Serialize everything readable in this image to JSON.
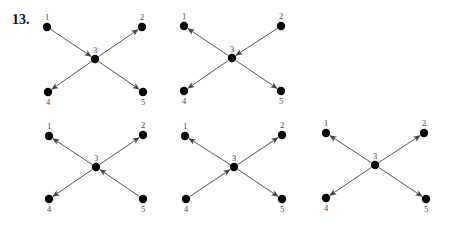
{
  "problem": {
    "number": "13."
  },
  "style": {
    "node_color": "#000000",
    "edge_color": "#555555",
    "label_color": "#444444",
    "background": "#ffffff"
  },
  "diagrams": [
    {
      "id": "graph-1",
      "nodes": [
        {
          "id": "1",
          "label": "1",
          "x": 47,
          "y": 27,
          "label_pos": "above"
        },
        {
          "id": "2",
          "label": "2",
          "x": 142,
          "y": 27,
          "label_pos": "above"
        },
        {
          "id": "3",
          "label": "3",
          "x": 95,
          "y": 59,
          "label_pos": "above"
        },
        {
          "id": "4",
          "label": "4",
          "x": 48,
          "y": 92,
          "label_pos": "below"
        },
        {
          "id": "5",
          "label": "5",
          "x": 143,
          "y": 92,
          "label_pos": "below"
        }
      ],
      "edges": [
        {
          "from": "1",
          "to": "3"
        },
        {
          "from": "3",
          "to": "2"
        },
        {
          "from": "3",
          "to": "4"
        },
        {
          "from": "3",
          "to": "5"
        }
      ]
    },
    {
      "id": "graph-2",
      "nodes": [
        {
          "id": "1",
          "label": "1",
          "x": 184,
          "y": 26,
          "label_pos": "above"
        },
        {
          "id": "2",
          "label": "2",
          "x": 281,
          "y": 26,
          "label_pos": "above"
        },
        {
          "id": "3",
          "label": "3",
          "x": 232,
          "y": 58,
          "label_pos": "above"
        },
        {
          "id": "4",
          "label": "4",
          "x": 184,
          "y": 91,
          "label_pos": "below"
        },
        {
          "id": "5",
          "label": "5",
          "x": 281,
          "y": 91,
          "label_pos": "below"
        }
      ],
      "edges": [
        {
          "from": "3",
          "to": "1"
        },
        {
          "from": "2",
          "to": "3"
        },
        {
          "from": "3",
          "to": "4"
        },
        {
          "from": "3",
          "to": "5"
        }
      ]
    },
    {
      "id": "graph-3",
      "nodes": [
        {
          "id": "1",
          "label": "1",
          "x": 49,
          "y": 136,
          "label_pos": "above"
        },
        {
          "id": "2",
          "label": "2",
          "x": 143,
          "y": 135,
          "label_pos": "above"
        },
        {
          "id": "3",
          "label": "3",
          "x": 96,
          "y": 167,
          "label_pos": "above"
        },
        {
          "id": "4",
          "label": "4",
          "x": 49,
          "y": 199,
          "label_pos": "below"
        },
        {
          "id": "5",
          "label": "5",
          "x": 143,
          "y": 199,
          "label_pos": "below"
        }
      ],
      "edges": [
        {
          "from": "3",
          "to": "1"
        },
        {
          "from": "3",
          "to": "2"
        },
        {
          "from": "3",
          "to": "4"
        },
        {
          "from": "5",
          "to": "3"
        }
      ]
    },
    {
      "id": "graph-4",
      "nodes": [
        {
          "id": "1",
          "label": "1",
          "x": 185,
          "y": 136,
          "label_pos": "above"
        },
        {
          "id": "2",
          "label": "2",
          "x": 282,
          "y": 135,
          "label_pos": "above"
        },
        {
          "id": "3",
          "label": "3",
          "x": 234,
          "y": 167,
          "label_pos": "above"
        },
        {
          "id": "4",
          "label": "4",
          "x": 186,
          "y": 199,
          "label_pos": "below"
        },
        {
          "id": "5",
          "label": "5",
          "x": 282,
          "y": 199,
          "label_pos": "below"
        }
      ],
      "edges": [
        {
          "from": "3",
          "to": "1"
        },
        {
          "from": "3",
          "to": "2"
        },
        {
          "from": "4",
          "to": "3"
        },
        {
          "from": "3",
          "to": "5"
        }
      ]
    },
    {
      "id": "graph-5",
      "nodes": [
        {
          "id": "1",
          "label": "1",
          "x": 326,
          "y": 133,
          "label_pos": "above"
        },
        {
          "id": "2",
          "label": "2",
          "x": 424,
          "y": 133,
          "label_pos": "above"
        },
        {
          "id": "3",
          "label": "3",
          "x": 375,
          "y": 165,
          "label_pos": "above"
        },
        {
          "id": "4",
          "label": "4",
          "x": 326,
          "y": 198,
          "label_pos": "below"
        },
        {
          "id": "5",
          "label": "5",
          "x": 426,
          "y": 199,
          "label_pos": "below"
        }
      ],
      "edges": [
        {
          "from": "3",
          "to": "1"
        },
        {
          "from": "3",
          "to": "2"
        },
        {
          "from": "3",
          "to": "4"
        },
        {
          "from": "3",
          "to": "5"
        }
      ]
    }
  ]
}
